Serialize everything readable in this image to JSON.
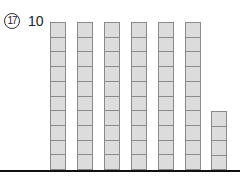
{
  "question": {
    "number": "17",
    "label": "10"
  },
  "diagram": {
    "type": "base-ten blocks",
    "columns": [
      {
        "units": 10,
        "left": 50
      },
      {
        "units": 10,
        "left": 77
      },
      {
        "units": 10,
        "left": 104
      },
      {
        "units": 10,
        "left": 131
      },
      {
        "units": 10,
        "left": 158
      },
      {
        "units": 10,
        "left": 185
      },
      {
        "units": 4,
        "left": 211
      }
    ],
    "tens_count": 6,
    "ones_count": 4,
    "colors": {
      "block_fill": "#dcdcdc",
      "block_border": "#8a8a8a",
      "baseline": "#111111"
    }
  }
}
